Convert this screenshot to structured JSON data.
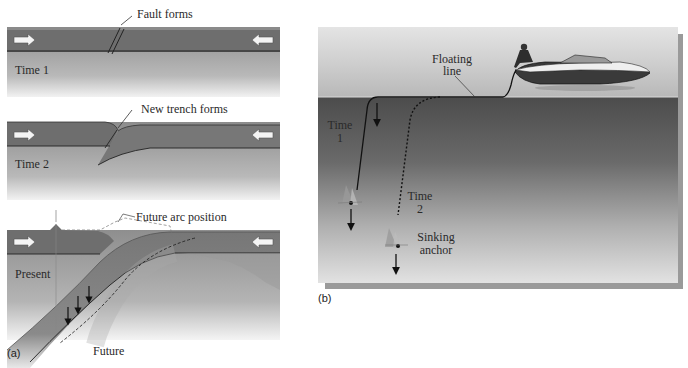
{
  "panel_a": {
    "letter": "(a)",
    "time1": {
      "stage_label": "Time 1",
      "callout": "Fault forms"
    },
    "time2": {
      "stage_label": "Time 2",
      "callout": "New trench forms"
    },
    "present": {
      "stage_label": "Present",
      "callout": "Future arc position",
      "bottom_label": "Future"
    },
    "colors": {
      "plate": "#6e6e6e",
      "plate_light": "#8a8a8a",
      "mantle_top": "#8f8f8f",
      "mantle_bottom": "#e6e6e6",
      "slab": "#7a7a7a"
    }
  },
  "panel_b": {
    "letter": "(b)",
    "labels": {
      "floating_line": [
        "Floating",
        "line"
      ],
      "time1": [
        "Time",
        "1"
      ],
      "time2": [
        "Time",
        "2"
      ],
      "sinking_anchor": [
        "Sinking",
        "anchor"
      ]
    },
    "colors": {
      "sky_top": "#d8d8d8",
      "sky_bottom": "#bdbdbd",
      "water_top": "#505050",
      "water_bottom": "#dcdcdc",
      "shadow": "#9a9a9a"
    }
  }
}
